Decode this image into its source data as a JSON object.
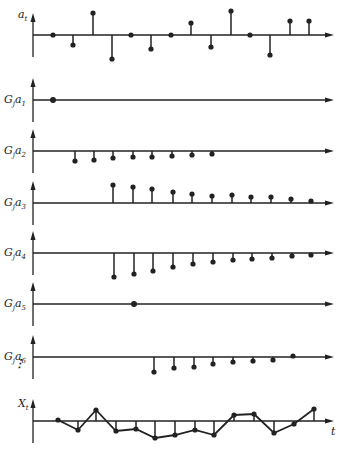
{
  "chart_data": {
    "type": "stem",
    "title": "",
    "x_axis_label": "t",
    "axis": {
      "x_start": 33,
      "x_end": 334,
      "color": "#222222"
    },
    "panels": [
      {
        "label_main": "a",
        "label_sub": "t",
        "axis_y": 35,
        "show_arrow_up": true,
        "x": [
          53,
          73,
          93,
          112,
          131,
          151,
          171,
          191,
          211,
          231,
          250,
          270,
          290,
          309
        ],
        "values": [
          0,
          -10,
          22,
          -24,
          0,
          -14,
          0,
          12,
          -12,
          24,
          0,
          -20,
          14,
          14
        ],
        "connect": false
      },
      {
        "label_main": "G_j a",
        "label_sub": "1",
        "axis_y": 100,
        "show_arrow_up": true,
        "x": [
          53
        ],
        "values": [
          0
        ],
        "connect": false
      },
      {
        "label_main": "G_j a",
        "label_sub": "2",
        "axis_y": 151,
        "show_arrow_up": true,
        "x": [
          75,
          94,
          113,
          133,
          152,
          172,
          192,
          212
        ],
        "values": [
          -10,
          -9,
          -7,
          -6,
          -6,
          -5,
          -4,
          -3
        ],
        "connect": false
      },
      {
        "label_main": "G_j a",
        "label_sub": "3",
        "axis_y": 203,
        "show_arrow_up": true,
        "x": [
          113,
          133,
          152,
          173,
          192,
          212,
          232,
          251,
          271,
          291,
          311
        ],
        "values": [
          18,
          16,
          14,
          11,
          9,
          7,
          8,
          6,
          6,
          4,
          2
        ],
        "connect": false
      },
      {
        "label_main": "G_j a",
        "label_sub": "4",
        "axis_y": 253,
        "show_arrow_up": true,
        "x": [
          114,
          134,
          153,
          173,
          193,
          213,
          233,
          252,
          272,
          292,
          311
        ],
        "values": [
          -24,
          -21,
          -18,
          -14,
          -11,
          -9,
          -7,
          -6,
          -5,
          -3,
          -2
        ],
        "connect": false
      },
      {
        "label_main": "G_j a",
        "label_sub": "5",
        "axis_y": 304,
        "show_arrow_up": true,
        "x": [
          134
        ],
        "values": [
          0
        ],
        "connect": false
      },
      {
        "label_main": "G_j a",
        "label_sub": "6",
        "axis_y": 357,
        "show_arrow_up": true,
        "x": [
          154,
          174,
          194,
          213,
          233,
          253,
          273,
          293
        ],
        "values": [
          -15,
          -11,
          -10,
          -7,
          -5,
          -4,
          -3,
          1
        ],
        "connect": false,
        "continuation_mark": "⋮"
      },
      {
        "label_main": "X",
        "label_sub": "t",
        "axis_y": 421,
        "show_arrow_up": true,
        "x": [
          58,
          78,
          96,
          116,
          136,
          155,
          175,
          195,
          214,
          234,
          254,
          274,
          294,
          314
        ],
        "values": [
          1,
          -9,
          11,
          -10,
          -8,
          -17,
          -14,
          -9,
          -14,
          6,
          7,
          -12,
          -3,
          12
        ],
        "connect": true,
        "time_label": "t"
      }
    ]
  }
}
